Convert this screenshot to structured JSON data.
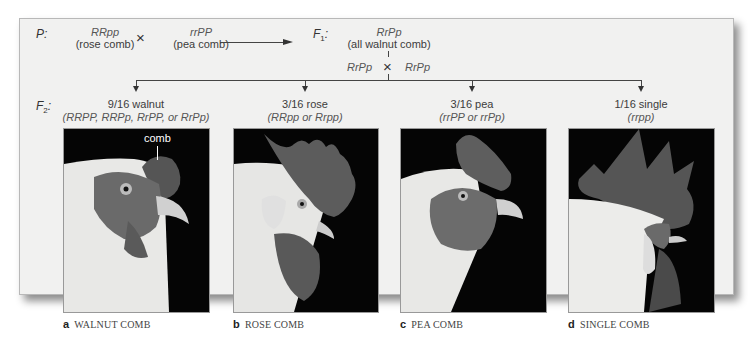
{
  "parental": {
    "label": "P",
    "parent1": {
      "genotype": "RRpp",
      "phenotype": "(rose comb)"
    },
    "cross_symbol": "×",
    "parent2": {
      "genotype": "rrPP",
      "phenotype": "(pea comb)"
    }
  },
  "f1": {
    "label": "F",
    "label_sub": "1",
    "genotype": "RrPp",
    "phenotype": "(all walnut comb)",
    "self_cross": {
      "left": "RrPp",
      "symbol": "×",
      "right": "RrPp"
    }
  },
  "f2": {
    "label": "F",
    "label_sub": "2",
    "classes": [
      {
        "ratio": "9/16 walnut",
        "genotypes": "(RRPP, RRPp, RrPP, or RrPp)",
        "caption_letter": "a",
        "caption": "WALNUT COMB",
        "annotation": "comb"
      },
      {
        "ratio": "3/16 rose",
        "genotypes": "(RRpp or Rrpp)",
        "caption_letter": "b",
        "caption": "ROSE COMB"
      },
      {
        "ratio": "3/16 pea",
        "genotypes": "(rrPP or rrPp)",
        "caption_letter": "c",
        "caption": "PEA COMB"
      },
      {
        "ratio": "1/16 single",
        "genotypes": "(rrpp)",
        "caption_letter": "d",
        "caption": "SINGLE COMB"
      }
    ]
  },
  "colors": {
    "panel_bg": "#f1f1f0",
    "photo_bg": "#050505",
    "line": "#444444"
  }
}
